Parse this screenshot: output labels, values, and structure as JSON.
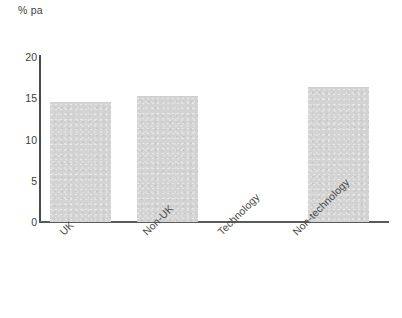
{
  "chart_data": {
    "type": "bar",
    "title": "",
    "subtitle": "",
    "xlabel": "",
    "ylabel": "% pa",
    "categories": [
      "UK",
      "Non-UK",
      "Technology",
      "Non-technology"
    ],
    "values": [
      14.4,
      15.2,
      0,
      16.2
    ],
    "ylim": [
      0,
      20
    ],
    "yticks": [
      0,
      5,
      10,
      15,
      20
    ],
    "ytick_labels": [
      "0",
      "5",
      "10",
      "15",
      "20"
    ],
    "grid": false,
    "legend": "none",
    "bar_color": "#d3d3d3",
    "axis_color": "#4a4a4a",
    "text_color": "#3d3d3d"
  },
  "axis": {
    "unit_label": "% pa"
  }
}
